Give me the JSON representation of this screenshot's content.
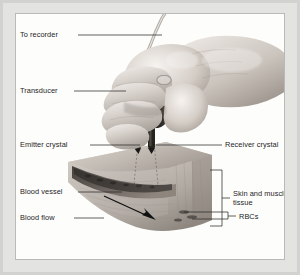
{
  "figure": {
    "domain_title": "Doppler ultrasound transducer on tissue",
    "background_color": "#d2d2d0",
    "panel_color": "#fdfdfc",
    "border_color": "#b9b9b6",
    "text_color": "#1d1d1d",
    "leader_color": "#2b2b2b"
  },
  "labels": {
    "to_recorder": "To recorder",
    "transducer": "Transducer",
    "emitter_crystal": "Emitter crystal",
    "receiver_crystal": "Receiver crystal",
    "blood_vessel": "Blood vessel",
    "blood_flow": "Blood flow",
    "skin_and_muscle_tissue": "Skin and muscle tissue",
    "rbcs": "RBCs"
  },
  "illustration": {
    "hand_label": "hand-gripping-probe",
    "probe_label": "transducer-probe",
    "cable_label": "transducer-cable",
    "tissue_label": "tissue-wedge",
    "vessel_label": "blood-vessel-band",
    "arrow_label": "blood-flow-arrow",
    "emitter_prong_label": "emitter-crystal-prong",
    "receiver_prong_label": "receiver-crystal-prong",
    "beam_label": "ultrasound-beam-path",
    "rbc_label": "red-blood-cells"
  }
}
